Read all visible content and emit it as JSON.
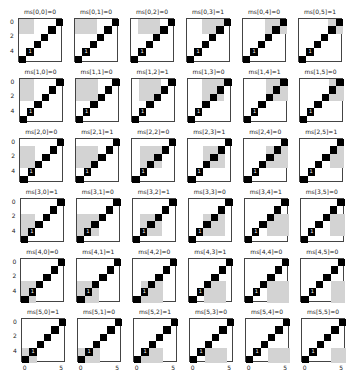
{
  "chart_data": {
    "type": "heatmap",
    "title": "",
    "grid_rows": 6,
    "grid_cols": 6,
    "matrix_size": 6,
    "ytick_labels": [
      "0",
      "2",
      "4"
    ],
    "ytick_values": [
      0,
      2,
      4
    ],
    "xtick_labels": [
      "0",
      "5"
    ],
    "xtick_values": [
      0,
      5
    ],
    "colors": {
      "background": "#ffffff",
      "highlight": "#d3d3d3",
      "diagonal": "#000000"
    },
    "black_cell_label": {
      "row": 4,
      "col": 1,
      "text": "1"
    },
    "ms": [
      [
        0,
        0,
        0,
        1,
        0,
        1
      ],
      [
        0,
        0,
        1,
        0,
        1,
        0
      ],
      [
        0,
        1,
        0,
        1,
        0,
        1
      ],
      [
        1,
        0,
        1,
        0,
        1,
        0
      ],
      [
        0,
        1,
        0,
        1,
        0,
        0
      ],
      [
        1,
        0,
        1,
        0,
        0,
        0
      ]
    ],
    "panel_titles": [
      [
        "ms[0,0]=0",
        "ms[0,1]=0",
        "ms[0,2]=0",
        "ms[0,3]=1",
        "ms[0,4]=0",
        "ms[0,5]=1"
      ],
      [
        "ms[1,0]=0",
        "ms[1,1]=0",
        "ms[1,2]=1",
        "ms[1,3]=0",
        "ms[1,4]=1",
        "ms[1,5]=0"
      ],
      [
        "ms[2,0]=0",
        "ms[2,1]=1",
        "ms[2,2]=0",
        "ms[2,3]=1",
        "ms[2,4]=0",
        "ms[2,5]=1"
      ],
      [
        "ms[3,0]=1",
        "ms[3,1]=0",
        "ms[3,2]=1",
        "ms[3,3]=0",
        "ms[3,4]=1",
        "ms[3,5]=0"
      ],
      [
        "ms[4,0]=0",
        "ms[4,1]=1",
        "ms[4,2]=0",
        "ms[4,3]=1",
        "ms[4,4]=0",
        "ms[4,5]=0"
      ],
      [
        "ms[5,0]=1",
        "ms[5,1]=0",
        "ms[5,2]=1",
        "ms[5,3]=0",
        "ms[5,4]=0",
        "ms[5,5]=0"
      ]
    ]
  }
}
